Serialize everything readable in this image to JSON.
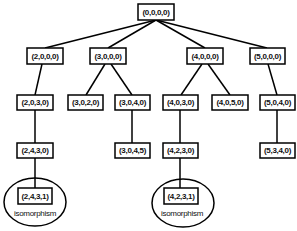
{
  "diagram": {
    "type": "tree",
    "nodes": {
      "n0": {
        "label": "(0,0,0,0)"
      },
      "n1": {
        "label": "(2,0,0,0)"
      },
      "n2": {
        "label": "(3,0,0,0)"
      },
      "n3": {
        "label": "(4,0,0,0)"
      },
      "n4": {
        "label": "(5,0,0,0)"
      },
      "n5": {
        "label": "(2,0,3,0)"
      },
      "n6": {
        "label": "(3,0,2,0)"
      },
      "n7": {
        "label": "(3,0,4,0)"
      },
      "n8": {
        "label": "(4,0,3,0)"
      },
      "n9": {
        "label": "(4,0,5,0)"
      },
      "n10": {
        "label": "(5,0,4,0)"
      },
      "n11": {
        "label": "(2,4,3,0)"
      },
      "n12": {
        "label": "(3,0,4,5)"
      },
      "n13": {
        "label": "(4,2,3,0)"
      },
      "n14": {
        "label": "(5,3,4,0)"
      },
      "n15": {
        "label": "(2,4,3,1)",
        "annotation": "isomorphism"
      },
      "n16": {
        "label": "(4,2,3,1)",
        "annotation": "isomorphism"
      }
    },
    "edges": [
      [
        "n0",
        "n1"
      ],
      [
        "n0",
        "n2"
      ],
      [
        "n0",
        "n3"
      ],
      [
        "n0",
        "n4"
      ],
      [
        "n1",
        "n5"
      ],
      [
        "n2",
        "n6"
      ],
      [
        "n2",
        "n7"
      ],
      [
        "n3",
        "n8"
      ],
      [
        "n3",
        "n9"
      ],
      [
        "n4",
        "n10"
      ],
      [
        "n5",
        "n11"
      ],
      [
        "n7",
        "n12"
      ],
      [
        "n8",
        "n13"
      ],
      [
        "n10",
        "n14"
      ],
      [
        "n11",
        "n15"
      ],
      [
        "n13",
        "n16"
      ]
    ],
    "colors": {
      "stroke": "#000000",
      "background": "#ffffff",
      "text": "#111111"
    }
  }
}
